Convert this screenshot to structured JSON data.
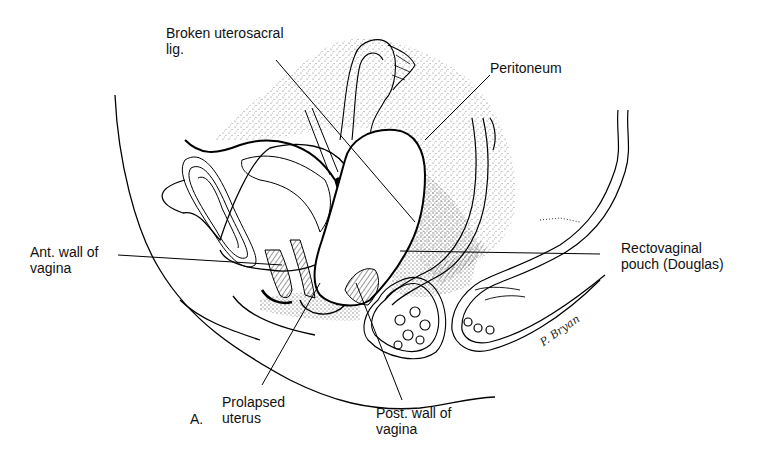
{
  "figure": {
    "panel_label": "A.",
    "signature": "P. Bryan",
    "labels": [
      {
        "id": "broken-uterosacral-lig",
        "lines": [
          "Broken uterosacral",
          "lig."
        ]
      },
      {
        "id": "peritoneum",
        "lines": [
          "Peritoneum"
        ]
      },
      {
        "id": "ant-wall-of-vagina",
        "lines": [
          "Ant. wall of",
          "vagina"
        ]
      },
      {
        "id": "rectovaginal-pouch",
        "lines": [
          "Rectovaginal",
          "pouch (Douglas)"
        ]
      },
      {
        "id": "prolapsed-uterus",
        "lines": [
          "Prolapsed",
          "uterus"
        ]
      },
      {
        "id": "post-wall-of-vagina",
        "lines": [
          "Post. wall of",
          "vagina"
        ]
      }
    ]
  }
}
